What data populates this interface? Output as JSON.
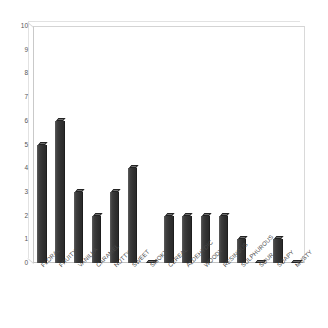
{
  "chart_data": {
    "type": "bar",
    "title": "",
    "subtitle": "",
    "xlabel": "",
    "ylabel": "",
    "ylim": [
      0,
      10
    ],
    "ytick_step": 1,
    "yticks": [
      0,
      1,
      2,
      3,
      4,
      5,
      6,
      7,
      8,
      9,
      10
    ],
    "grid": false,
    "legend": false,
    "legend_position": "none",
    "xtick_rotation_deg": -45,
    "style": "3d-bar",
    "categories": [
      "FLORAL",
      "FRUITY",
      "VANILLA",
      "CARAMEL",
      "NUTTY",
      "SWEET",
      "SMOKY",
      "CEREAL",
      "ALDEHYDIC",
      "WOODY",
      "RESINOUS",
      "SULPHUROUS",
      "SOUR",
      "SOAPY",
      "MUSTY"
    ],
    "values": [
      5,
      6,
      3,
      2,
      3,
      4,
      0,
      2,
      2,
      2,
      2,
      1,
      0,
      1,
      0
    ],
    "series": [
      {
        "name": "Series 1",
        "values": [
          5,
          6,
          3,
          2,
          3,
          4,
          0,
          2,
          2,
          2,
          2,
          1,
          0,
          1,
          0
        ]
      }
    ],
    "colors": {
      "bar_face": "#3a3a3a",
      "bar_top": "#6d6d6d",
      "bar_edge": "#1e1e1e",
      "axis_line": "#c9c9c9",
      "tick_text": "#555555",
      "label_text": "#4a4a4a",
      "plot_background": "#ffffff",
      "page_background": "#ffffff"
    }
  }
}
